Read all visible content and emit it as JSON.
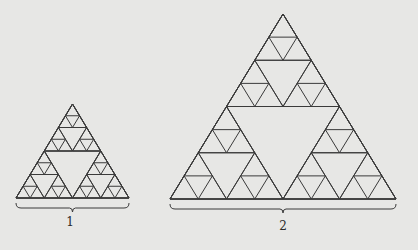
{
  "figure": {
    "background": "#e7e7e5",
    "stroke": "#3a3a3a",
    "triangles": [
      {
        "id": "1",
        "label": "1",
        "apex": [
          72.5,
          104
        ],
        "base_left": [
          16,
          198
        ],
        "base_right": [
          129,
          198
        ],
        "depth": 4,
        "brace_y": 203,
        "label_pos": [
          70,
          215
        ]
      },
      {
        "id": "2",
        "label": "2",
        "apex": [
          283,
          14
        ],
        "base_left": [
          170,
          199
        ],
        "base_right": [
          396,
          199
        ],
        "depth": 4,
        "brace_y": 204,
        "label_pos": [
          283,
          219
        ]
      }
    ]
  }
}
